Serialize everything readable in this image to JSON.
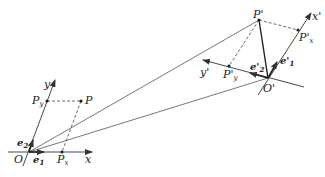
{
  "diagram": {
    "type": "coordinate-frame-transformation",
    "frames": [
      {
        "name": "original",
        "origin_label": "O",
        "x_axis_label": "x",
        "y_axis_label": "y",
        "basis_labels": [
          "e",
          "e"
        ],
        "basis_subscripts": [
          "1",
          "2"
        ],
        "point_label": "P",
        "projection_labels": [
          "P",
          "P"
        ],
        "projection_subscripts": [
          "x",
          "y"
        ]
      },
      {
        "name": "transformed",
        "origin_label": "O'",
        "x_axis_label": "x'",
        "y_axis_label": "y'",
        "basis_labels": [
          "e'",
          "e'"
        ],
        "basis_subscripts": [
          "1",
          "2"
        ],
        "point_label": "P'",
        "projection_labels": [
          "P'",
          "P'"
        ],
        "projection_subscripts": [
          "x",
          "y"
        ]
      }
    ],
    "colors": {
      "line": "#333333",
      "background": "#ffffff"
    }
  }
}
